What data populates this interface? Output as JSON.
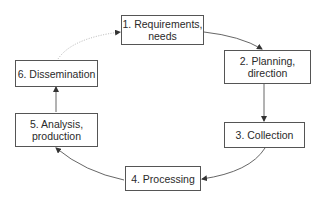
{
  "diagram": {
    "type": "cycle",
    "nodes": [
      {
        "id": "n1",
        "line1": "1. Requirements,",
        "line2": "needs"
      },
      {
        "id": "n2",
        "line1": "2. Planning,",
        "line2": "direction"
      },
      {
        "id": "n3",
        "line1": "3. Collection",
        "line2": ""
      },
      {
        "id": "n4",
        "line1": "4. Processing",
        "line2": ""
      },
      {
        "id": "n5",
        "line1": "5. Analysis,",
        "line2": "production"
      },
      {
        "id": "n6",
        "line1": "6. Dissemination",
        "line2": ""
      }
    ],
    "edges": [
      {
        "from": "n1",
        "to": "n2",
        "style": "solid"
      },
      {
        "from": "n2",
        "to": "n3",
        "style": "solid"
      },
      {
        "from": "n3",
        "to": "n4",
        "style": "solid"
      },
      {
        "from": "n4",
        "to": "n5",
        "style": "solid"
      },
      {
        "from": "n5",
        "to": "n6",
        "style": "solid"
      },
      {
        "from": "n6",
        "to": "n1",
        "style": "dotted"
      }
    ],
    "colors": {
      "stroke": "#555555",
      "dotted_stroke": "#aaaaaa",
      "text": "#2a2a2a",
      "background": "#ffffff"
    }
  }
}
